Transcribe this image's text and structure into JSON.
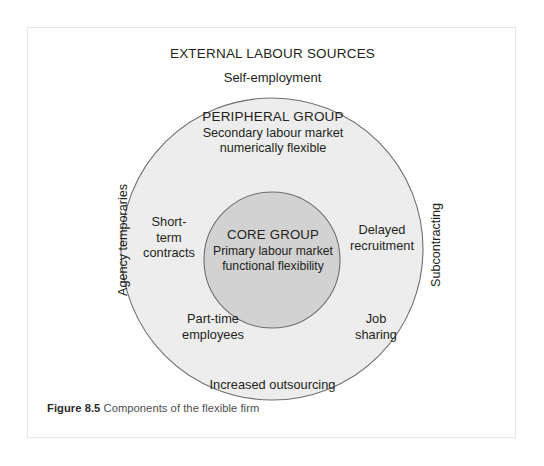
{
  "figure": {
    "caption_label": "Figure 8.5",
    "caption_text": " Components of the flexible firm"
  },
  "diagram": {
    "title": "EXTERNAL LABOUR SOURCES",
    "outer_ring": {
      "heading": "PERIPHERAL GROUP",
      "description": "Secondary labour market\nnumerically flexible",
      "fill_color": "#ededed",
      "stroke_color": "#6e6e6e"
    },
    "inner_circle": {
      "heading": "CORE GROUP",
      "description": "Primary labour market\nfunctional flexibility",
      "fill_color": "#d2d2d2",
      "stroke_color": "#6e6e6e"
    },
    "external_sources": [
      {
        "name": "self-employment",
        "label": "Self-employment",
        "position": "top"
      },
      {
        "name": "agency-temporaries",
        "label": "Agency temporaries",
        "position": "left-vertical"
      },
      {
        "name": "subcontracting",
        "label": "Subcontracting",
        "position": "right-vertical"
      },
      {
        "name": "increased-outsourcing",
        "label": "Increased outsourcing",
        "position": "bottom"
      }
    ],
    "peripheral_items": [
      {
        "name": "short-term-contracts",
        "label": "Short-\nterm\ncontracts",
        "position": "left"
      },
      {
        "name": "delayed-recruitment",
        "label": "Delayed\nrecruitment",
        "position": "right"
      },
      {
        "name": "part-time-employees",
        "label": "Part-time\nemployees",
        "position": "bottom-left"
      },
      {
        "name": "job-sharing",
        "label": "Job\nsharing",
        "position": "bottom-right"
      }
    ]
  }
}
